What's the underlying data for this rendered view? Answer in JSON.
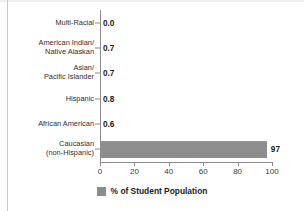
{
  "chart_data": {
    "type": "bar",
    "orientation": "horizontal",
    "title": "",
    "xlabel": "",
    "ylabel": "",
    "xlim": [
      0,
      100
    ],
    "xticks": [
      0,
      20,
      40,
      60,
      80,
      100
    ],
    "xtick_labels": [
      "0",
      "20",
      "40",
      "60",
      "80",
      "100"
    ],
    "grid": false,
    "legend": {
      "position": "bottom-center",
      "entries": [
        {
          "label": "% of Student Population",
          "color": "#8d8d8d",
          "swatch": "legend-swatch"
        }
      ]
    },
    "categories": [
      "Multi-Racial",
      "American Indian/\nNative Alaskan",
      "Asian/\nPacific Islander",
      "Hispanic",
      "African American",
      "Caucasian\n(non-Hispanic)"
    ],
    "values": [
      0.0,
      0.7,
      0.7,
      0.8,
      0.6,
      97
    ],
    "value_labels": [
      "0.0",
      "0.7",
      "0.7",
      "0.8",
      "0.6",
      "97"
    ],
    "series": [
      {
        "name": "% of Student Population",
        "color": "#8d8d8d",
        "values": [
          0.0,
          0.7,
          0.7,
          0.8,
          0.6,
          97
        ]
      }
    ]
  },
  "colors": {
    "bar": "#8d8d8d",
    "axis": "#8c8c8c",
    "text": "#2f2f2f",
    "value_text": "#1a1a1a",
    "background": "#ffffff"
  }
}
